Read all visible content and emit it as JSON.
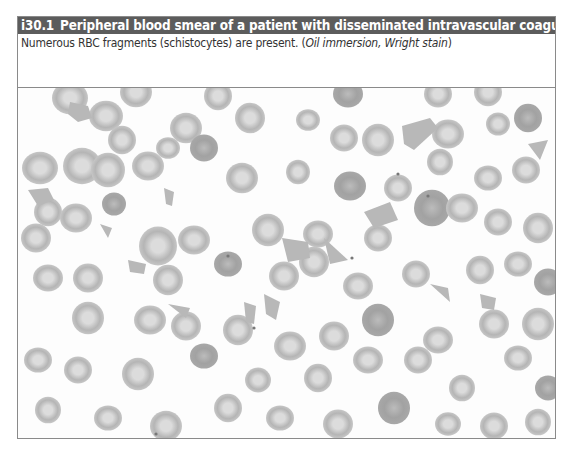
{
  "figure": {
    "number": "i30.1",
    "title": "Peripheral blood smear of a patient with disseminated intravascular coagulation",
    "caption_main": "Numerous RBC fragments (schistocytes) are present. (",
    "caption_italic": "Oil immersion, Wright stain",
    "caption_end": ")",
    "image": {
      "description": "Micrograph of peripheral blood smear showing red blood cells with schistocytes",
      "colors": {
        "background": "#fdfdfd",
        "cell_rim": "#b5b5b5",
        "cell_center": "#dcdcdc",
        "dark_cell": "#a2a2a2",
        "fragment": "#b8b8b8"
      },
      "cells": [
        [
          52,
          10,
          18
        ],
        [
          118,
          4,
          16
        ],
        [
          200,
          8,
          14
        ],
        [
          330,
          6,
          15
        ],
        [
          420,
          6,
          14
        ],
        [
          470,
          4,
          14
        ],
        [
          88,
          28,
          17
        ],
        [
          168,
          40,
          16
        ],
        [
          104,
          52,
          14
        ],
        [
          150,
          60,
          12
        ],
        [
          186,
          60,
          14
        ],
        [
          232,
          30,
          15
        ],
        [
          290,
          32,
          12
        ],
        [
          326,
          50,
          14
        ],
        [
          360,
          52,
          16
        ],
        [
          430,
          46,
          16
        ],
        [
          480,
          36,
          12
        ],
        [
          510,
          30,
          14
        ],
        [
          22,
          80,
          18
        ],
        [
          64,
          78,
          19
        ],
        [
          90,
          82,
          17
        ],
        [
          130,
          78,
          16
        ],
        [
          224,
          90,
          16
        ],
        [
          280,
          84,
          12
        ],
        [
          332,
          98,
          16
        ],
        [
          380,
          100,
          14
        ],
        [
          422,
          74,
          13
        ],
        [
          470,
          90,
          14
        ],
        [
          508,
          82,
          14
        ],
        [
          30,
          124,
          14
        ],
        [
          58,
          130,
          16
        ],
        [
          96,
          116,
          12
        ],
        [
          140,
          158,
          19
        ],
        [
          176,
          152,
          16
        ],
        [
          18,
          150,
          15
        ],
        [
          250,
          142,
          16
        ],
        [
          300,
          146,
          15
        ],
        [
          360,
          150,
          14
        ],
        [
          414,
          120,
          18
        ],
        [
          444,
          120,
          16
        ],
        [
          480,
          134,
          14
        ],
        [
          520,
          140,
          15
        ],
        [
          30,
          190,
          15
        ],
        [
          70,
          190,
          15
        ],
        [
          150,
          192,
          15
        ],
        [
          210,
          176,
          14
        ],
        [
          266,
          188,
          15
        ],
        [
          296,
          174,
          15
        ],
        [
          340,
          198,
          15
        ],
        [
          398,
          186,
          14
        ],
        [
          462,
          182,
          14
        ],
        [
          500,
          176,
          14
        ],
        [
          530,
          194,
          14
        ],
        [
          70,
          230,
          16
        ],
        [
          132,
          232,
          16
        ],
        [
          168,
          238,
          15
        ],
        [
          220,
          242,
          15
        ],
        [
          272,
          258,
          16
        ],
        [
          316,
          248,
          15
        ],
        [
          360,
          232,
          16
        ],
        [
          420,
          252,
          15
        ],
        [
          476,
          236,
          15
        ],
        [
          520,
          236,
          16
        ],
        [
          20,
          272,
          14
        ],
        [
          60,
          282,
          14
        ],
        [
          120,
          286,
          16
        ],
        [
          186,
          268,
          14
        ],
        [
          240,
          292,
          13
        ],
        [
          300,
          290,
          14
        ],
        [
          350,
          272,
          15
        ],
        [
          400,
          272,
          14
        ],
        [
          444,
          300,
          13
        ],
        [
          500,
          270,
          14
        ],
        [
          530,
          300,
          13
        ],
        [
          30,
          322,
          13
        ],
        [
          90,
          330,
          14
        ],
        [
          148,
          338,
          16
        ],
        [
          210,
          320,
          14
        ],
        [
          262,
          330,
          14
        ],
        [
          320,
          336,
          15
        ],
        [
          376,
          320,
          16
        ],
        [
          430,
          336,
          13
        ],
        [
          476,
          338,
          14
        ],
        [
          520,
          334,
          13
        ]
      ],
      "fragments": [
        [
          60,
          22,
          "M52,14 L70,18 L74,30 L60,34 L50,26 Z"
        ],
        [
          26,
          108,
          "M10,102 L30,100 L36,112 L20,118 Z"
        ],
        [
          150,
          108,
          "M146,100 L156,104 L154,118 L148,116 Z"
        ],
        [
          270,
          160,
          "M264,150 L290,154 L292,170 L270,174 Z"
        ],
        [
          310,
          160,
          "M306,150 L330,172 L312,176 Z"
        ],
        [
          360,
          124,
          "M346,124 L372,114 L380,132 L356,140 Z"
        ],
        [
          400,
          40,
          "M384,38 L412,30 L420,40 L396,62 L386,56 Z"
        ],
        [
          520,
          62,
          "M510,56 L530,52 L522,72 Z"
        ],
        [
          118,
          178,
          "M110,172 L128,176 L126,186 L112,184 Z"
        ],
        [
          160,
          224,
          "M150,216 L172,220 L168,230 Z"
        ],
        [
          232,
          224,
          "M226,214 L238,218 L236,236 L228,234 Z"
        ],
        [
          254,
          220,
          "M246,206 L262,214 L258,232 L248,226 Z"
        ],
        [
          424,
          204,
          "M412,196 L430,200 L432,214 Z"
        ],
        [
          470,
          214,
          "M462,206 L478,210 L476,222 L464,220 Z"
        ],
        [
          86,
          142,
          "M82,136 L94,140 L90,150 Z"
        ]
      ],
      "dots": [
        [
          210,
          168
        ],
        [
          236,
          240
        ],
        [
          410,
          108
        ],
        [
          334,
          170
        ],
        [
          380,
          86
        ],
        [
          138,
          346
        ]
      ]
    }
  }
}
